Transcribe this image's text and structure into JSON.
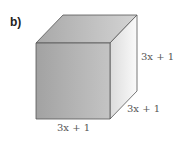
{
  "part_label": "b)",
  "shape": "cube",
  "dimensions": {
    "height": "3x + 1",
    "depth": "3x + 1",
    "width": "3x + 1"
  },
  "colors": {
    "front_face": "#a9a9a9",
    "top_face": "#b8b8b8",
    "right_face": "#f0f0f0",
    "edge": "#555555"
  }
}
